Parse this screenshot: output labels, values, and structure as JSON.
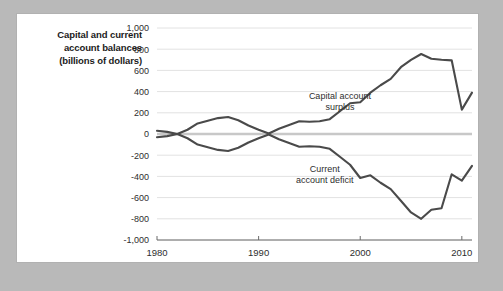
{
  "title_lines": [
    "Capital and current",
    "account balances",
    "(billions of dollars)"
  ],
  "colors": {
    "line": "#4a4a4a",
    "gridline": "#e2e2e2",
    "zeroline": "#c8c8c8",
    "axis": "#6b6b6b",
    "card_background": "#ffffff",
    "page_background": "#b9b9b9"
  },
  "chart_data": {
    "type": "line",
    "title": "Capital and current account balances (billions of dollars)",
    "xlabel": "",
    "ylabel": "billions of dollars",
    "xlim": [
      1980,
      2011
    ],
    "ylim": [
      -1000,
      1000
    ],
    "grid": true,
    "legend": "inline-annotations",
    "ytick_labels": [
      "1,000",
      "800",
      "600",
      "400",
      "200",
      "0",
      "-200",
      "-400",
      "-600",
      "-800",
      "-1,000"
    ],
    "ytick_values": [
      1000,
      800,
      600,
      400,
      200,
      0,
      -200,
      -400,
      -600,
      -800,
      -1000
    ],
    "xtick_labels": [
      "1980",
      "1990",
      "2000",
      "2010"
    ],
    "xtick_values": [
      1980,
      1990,
      2000,
      2010
    ],
    "annotations": [
      {
        "text": "Capital account surplus",
        "lines": [
          "Capital account",
          "surplus"
        ],
        "x": 1998,
        "y": 330
      },
      {
        "text": "Current account deficit",
        "lines": [
          "Current",
          "account deficit"
        ],
        "x": 1996.5,
        "y": -360
      }
    ],
    "x": [
      1980,
      1981,
      1982,
      1983,
      1984,
      1985,
      1986,
      1987,
      1988,
      1989,
      1990,
      1991,
      1992,
      1993,
      1994,
      1995,
      1996,
      1997,
      1998,
      1999,
      2000,
      2001,
      2002,
      2003,
      2004,
      2005,
      2006,
      2007,
      2008,
      2009,
      2010,
      2011
    ],
    "series": [
      {
        "name": "Capital account surplus",
        "values": [
          30,
          20,
          0,
          40,
          100,
          125,
          150,
          160,
          130,
          80,
          40,
          5,
          50,
          85,
          120,
          115,
          120,
          140,
          215,
          290,
          300,
          390,
          460,
          520,
          630,
          700,
          755,
          710,
          700,
          695,
          230,
          390
        ]
      },
      {
        "name": "Current account deficit",
        "values": [
          -30,
          -20,
          0,
          -40,
          -100,
          -125,
          -150,
          -160,
          -130,
          -80,
          -40,
          -5,
          -50,
          -85,
          -120,
          -115,
          -120,
          -140,
          -215,
          -290,
          -415,
          -390,
          -460,
          -520,
          -630,
          -740,
          -800,
          -715,
          -700,
          -380,
          -440,
          -300
        ]
      }
    ]
  }
}
